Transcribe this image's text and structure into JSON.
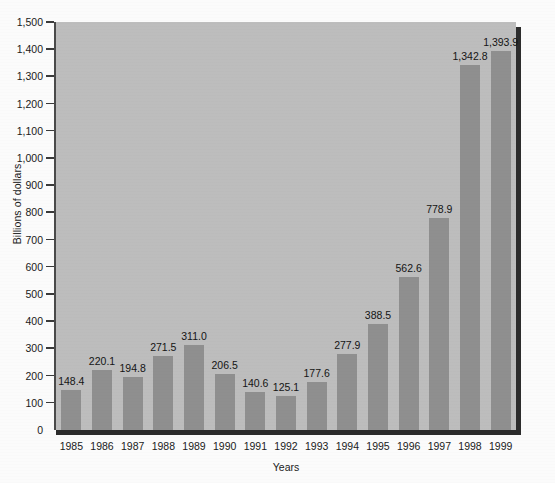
{
  "chart_data": {
    "type": "bar",
    "title": "",
    "xlabel": "Years",
    "ylabel": "Billions of dollars",
    "categories": [
      "1985",
      "1986",
      "1987",
      "1988",
      "1989",
      "1990",
      "1991",
      "1992",
      "1993",
      "1994",
      "1995",
      "1996",
      "1997",
      "1998",
      "1999"
    ],
    "values": [
      148.4,
      220.1,
      194.8,
      271.5,
      311.0,
      206.5,
      140.6,
      125.1,
      177.6,
      277.9,
      388.5,
      562.6,
      778.9,
      1342.8,
      1393.9
    ],
    "value_labels": [
      "148.4",
      "220.1",
      "194.8",
      "271.5",
      "311.0",
      "206.5",
      "140.6",
      "125.1",
      "177.6",
      "277.9",
      "388.5",
      "562.6",
      "778.9",
      "1,342.8",
      "1,393.9"
    ],
    "ylim": [
      0,
      1500
    ],
    "ytick_values": [
      0,
      100,
      200,
      300,
      400,
      500,
      600,
      700,
      800,
      900,
      1000,
      1100,
      1200,
      1300,
      1400,
      1500
    ],
    "ytick_labels": [
      "0",
      "100",
      "200",
      "300",
      "400",
      "500",
      "600",
      "700",
      "800",
      "900",
      "1,000",
      "1,100",
      "1,200",
      "1,300",
      "1,400",
      "1,500"
    ],
    "grid": false,
    "legend": "none",
    "bar_color": "#8f8f8f",
    "plot_background": "#bdbdbd",
    "page_background": "#fbfbfb",
    "axis_color": "#2c2c2c"
  }
}
